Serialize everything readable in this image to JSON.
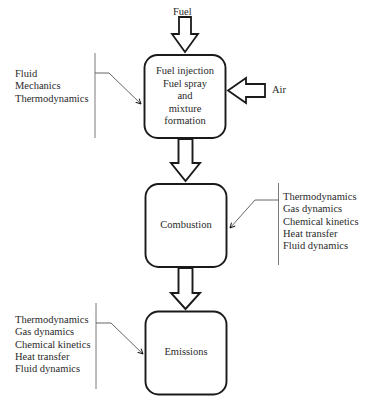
{
  "inputs": {
    "fuel_label": "Fuel",
    "air_label": "Air"
  },
  "stages": [
    {
      "name": "mixture-formation",
      "lines": [
        "Fuel injection",
        "Fuel spray",
        "and",
        "mixture",
        "formation"
      ]
    },
    {
      "name": "combustion",
      "lines": [
        "Combustion"
      ]
    },
    {
      "name": "emissions",
      "lines": [
        "Emissions"
      ]
    }
  ],
  "disciplines": [
    {
      "attached_to": "mixture-formation",
      "side": "left",
      "items": [
        "Fluid",
        "Mechanics",
        "Thermodynamics"
      ]
    },
    {
      "attached_to": "combustion",
      "side": "right",
      "items": [
        "Thermodynamics",
        "Gas dynamics",
        "Chemical kinetics",
        "Heat transfer",
        "Fluid dynamics"
      ]
    },
    {
      "attached_to": "emissions",
      "side": "left",
      "items": [
        "Thermodynamics",
        "Gas dynamics",
        "Chemical kinetics",
        "Heat transfer",
        "Fluid dynamics"
      ]
    }
  ],
  "colors": {
    "stroke": "#1a1a1a",
    "bracket": "#7a7a7a",
    "text": "#2a2a2a"
  }
}
